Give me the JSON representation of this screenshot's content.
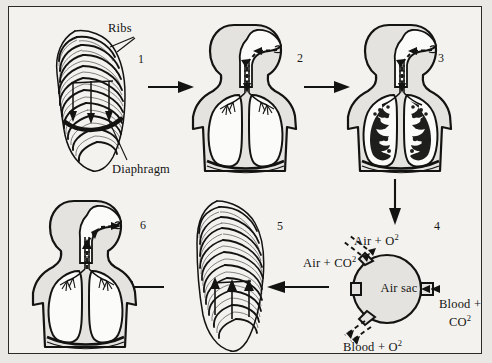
{
  "figure": {
    "background": "#f3f2ef",
    "ink_color": "#131311"
  },
  "annotations": {
    "ribs": "Ribs",
    "diaphragm": "Diaphragm"
  },
  "steps": [
    {
      "number": "1",
      "x": 137,
      "y": 52,
      "subject": "ribcage-inhale"
    },
    {
      "number": "2",
      "x": 296,
      "y": 51,
      "subject": "torso-inhale"
    },
    {
      "number": "3",
      "x": 437,
      "y": 51,
      "subject": "torso-lungs-filled"
    },
    {
      "number": "4",
      "x": 433,
      "y": 219,
      "subject": "air-sac-exchange"
    },
    {
      "number": "5",
      "x": 276,
      "y": 219,
      "subject": "ribcage-exhale"
    },
    {
      "number": "6",
      "x": 139,
      "y": 218,
      "subject": "torso-exhale"
    }
  ],
  "air_sac": {
    "center_label": "Air sac",
    "inflow_air": "Air + O",
    "inflow_air_sup": "2",
    "outflow_air": "Air + CO",
    "outflow_air_sup": "2",
    "inflow_blood": "Blood +",
    "inflow_blood_line2": "CO",
    "inflow_blood_sup": "2",
    "outflow_blood": "Blood + O",
    "outflow_blood_sup": "2"
  }
}
